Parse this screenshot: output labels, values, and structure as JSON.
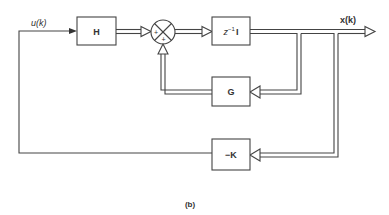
{
  "diagram": {
    "type": "block-diagram",
    "blocks": [
      {
        "id": "H",
        "label": "H"
      },
      {
        "id": "delay",
        "label_main": "z",
        "label_sup": "−1",
        "label_suffix": "I"
      },
      {
        "id": "G",
        "label": "G"
      },
      {
        "id": "K",
        "label": "−K"
      }
    ],
    "summing_junction": {
      "signs": [
        "+",
        "+"
      ]
    },
    "signals": {
      "input": "u(k)",
      "state": "x(k)"
    },
    "caption": "(b)"
  }
}
